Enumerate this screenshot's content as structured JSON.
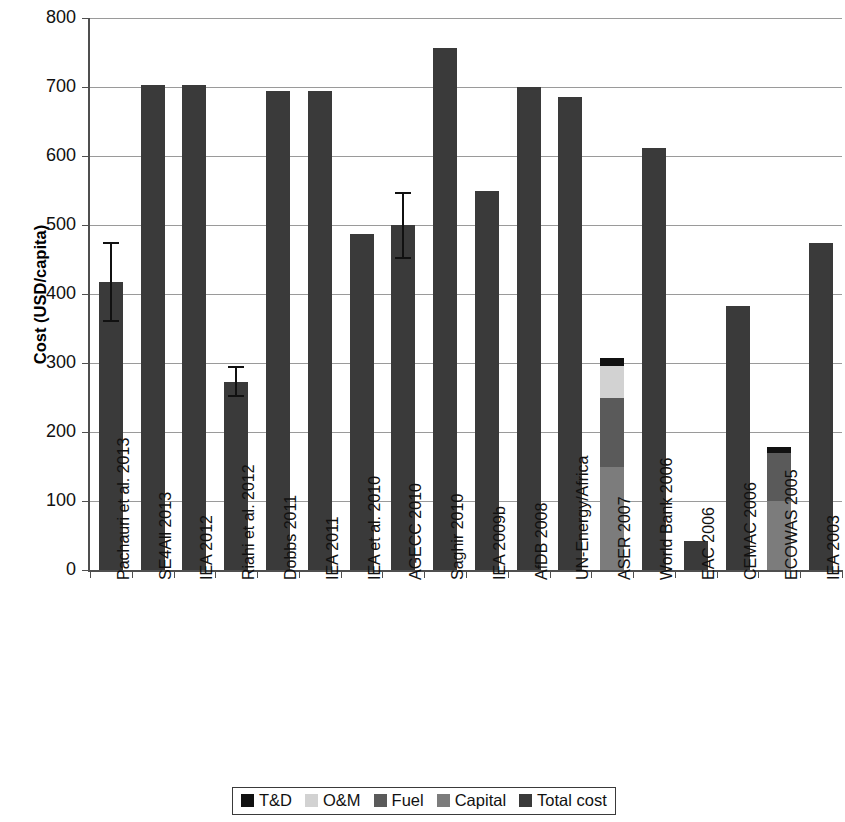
{
  "chart_data": {
    "type": "bar",
    "title": "",
    "subtitle": "",
    "xlabel": "",
    "ylabel": "Cost (USD/capita)",
    "ylim": [
      0,
      800
    ],
    "ytick_labels": [
      "800",
      "700",
      "600",
      "500",
      "400",
      "300",
      "200",
      "100",
      "0"
    ],
    "yticks": [
      800,
      700,
      600,
      500,
      400,
      300,
      200,
      100,
      0
    ],
    "grid": true,
    "legend_position": "bottom",
    "stacked": true,
    "categories": [
      "Pachauri et al. 2013",
      "SE4All 2013",
      "IEA 2012",
      "Riahi et al. 2012",
      "Dobbs 2011",
      "IEA 2011",
      "IEA et al. 2010",
      "AGECC 2010",
      "Saghir 2010",
      "IEA 2009b",
      "AfDB 2008",
      "UN-Energy/Africa",
      "ASER 2007",
      "World Bank 2006",
      "EAC 2006",
      "CEMAC 2006",
      "ECOWAS 2005",
      "IEA 2003"
    ],
    "series": [
      {
        "name": "Capital",
        "color": "#7c7c7c",
        "values": [
          0,
          0,
          0,
          0,
          0,
          0,
          0,
          0,
          0,
          0,
          0,
          0,
          150,
          0,
          0,
          0,
          100,
          0
        ]
      },
      {
        "name": "Fuel",
        "color": "#5a5a5a",
        "values": [
          0,
          0,
          0,
          0,
          0,
          0,
          0,
          0,
          0,
          0,
          0,
          0,
          100,
          0,
          0,
          0,
          70,
          0
        ]
      },
      {
        "name": "O&M",
        "color": "#d2d2d2",
        "values": [
          0,
          0,
          0,
          0,
          0,
          0,
          0,
          0,
          0,
          0,
          0,
          0,
          45,
          0,
          0,
          0,
          0,
          0
        ]
      },
      {
        "name": "T&D",
        "color": "#111111",
        "values": [
          0,
          0,
          0,
          0,
          0,
          0,
          0,
          0,
          0,
          0,
          0,
          0,
          12,
          0,
          0,
          0,
          8,
          0
        ]
      },
      {
        "name": "Total cost",
        "color": "#3a3a3a",
        "values": [
          417,
          703,
          703,
          272,
          694,
          694,
          487,
          500,
          756,
          550,
          700,
          686,
          0,
          612,
          42,
          382,
          0,
          474
        ]
      }
    ],
    "error_bars": [
      {
        "category": "Pachauri et al. 2013",
        "index": 0,
        "value": 417,
        "low": 360,
        "high": 475
      },
      {
        "category": "Riahi et al. 2012",
        "index": 3,
        "value": 272,
        "low": 250,
        "high": 295
      },
      {
        "category": "AGECC 2010",
        "index": 7,
        "value": 500,
        "low": 450,
        "high": 548
      }
    ],
    "annotations": []
  },
  "legend": {
    "items": [
      {
        "label": "T&D",
        "color": "#111111",
        "icon": "square-swatch-icon"
      },
      {
        "label": "O&M",
        "color": "#d2d2d2",
        "icon": "square-swatch-icon"
      },
      {
        "label": "Fuel",
        "color": "#5a5a5a",
        "icon": "square-swatch-icon"
      },
      {
        "label": "Capital",
        "color": "#7c7c7c",
        "icon": "square-swatch-icon"
      },
      {
        "label": "Total cost",
        "color": "#3a3a3a",
        "icon": "square-swatch-icon"
      }
    ]
  },
  "colors": {
    "axis": "#4f4f4f",
    "grid": "#9a9a9a",
    "background": "#ffffff",
    "text": "#111111"
  }
}
